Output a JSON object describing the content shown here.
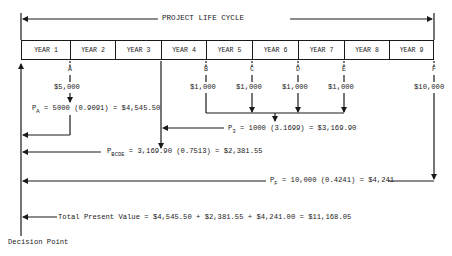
{
  "diagram": {
    "title": "PROJECT LIFE CYCLE",
    "years": [
      "YEAR 1",
      "YEAR 2",
      "YEAR 3",
      "YEAR 4",
      "YEAR 5",
      "YEAR 6",
      "YEAR 7",
      "YEAR 8",
      "YEAR 9"
    ],
    "cash_flow_points": [
      {
        "label": "A",
        "amount": "$5,000"
      },
      {
        "label": "B",
        "amount": "$1,000"
      },
      {
        "label": "C",
        "amount": "$1,000"
      },
      {
        "label": "D",
        "amount": "$1,000"
      },
      {
        "label": "E",
        "amount": "$1,000"
      },
      {
        "label": "F",
        "amount": "$10,000"
      }
    ],
    "equations": {
      "pa": {
        "symbol": "P",
        "subscript": "A",
        "expression": "=  5000 (0.9091) = $4,545.50"
      },
      "p3": {
        "symbol": "P",
        "subscript": "3",
        "expression": "=  1000 (3.1699) = $3,169.90"
      },
      "pbcde": {
        "symbol": "P",
        "subscript": "BCDE",
        "expression": "=  3,169.90 (0.7513) = $2,381.55"
      },
      "pf": {
        "symbol": "P",
        "subscript": "F",
        "expression": "=  10,000 (0.4241) = $4,241"
      },
      "total": {
        "label": "Total Present Value",
        "expression": "=  $4,545.50 + $2,381.55 + $4,241.00 = $11,168.05"
      }
    },
    "decision_point_label": "Decision Point"
  }
}
